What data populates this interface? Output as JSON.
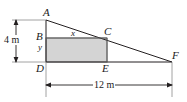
{
  "figure": {
    "type": "geometry-diagram",
    "vertices": [
      {
        "id": "A",
        "label": "A",
        "x": 46,
        "y": 20
      },
      {
        "id": "B",
        "label": "B",
        "x": 46,
        "y": 38
      },
      {
        "id": "C",
        "label": "C",
        "x": 107,
        "y": 38
      },
      {
        "id": "D",
        "label": "D",
        "x": 46,
        "y": 62
      },
      {
        "id": "E",
        "label": "E",
        "x": 107,
        "y": 62
      },
      {
        "id": "F",
        "label": "F",
        "x": 172,
        "y": 62
      }
    ],
    "side_labels": [
      {
        "id": "x",
        "label": "x",
        "meaning": "rectangle width BC"
      },
      {
        "id": "y",
        "label": "y",
        "meaning": "rectangle height BD"
      }
    ],
    "dimensions": [
      {
        "id": "height",
        "label": "4 m",
        "value": 4,
        "unit": "m",
        "orientation": "vertical",
        "measures": "AD"
      },
      {
        "id": "base",
        "label": "12 m",
        "value": 12,
        "unit": "m",
        "orientation": "horizontal",
        "measures": "DF"
      }
    ],
    "colors": {
      "stroke": "#231f20",
      "rectangle_fill": "#d4d4d4",
      "rectangle_stroke": "#6f6f6f",
      "dimension_line": "#231f20",
      "background": "#ffffff"
    }
  }
}
